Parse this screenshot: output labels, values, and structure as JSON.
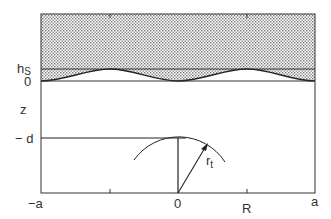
{
  "diagram": {
    "type": "schematic cross-section",
    "labels": {
      "hs": "h",
      "hs_sub": "S",
      "zero_z": "0",
      "z_axis": "z",
      "minus_d": "− d",
      "minus_a": "−a",
      "zero_x": "0",
      "R": "R",
      "a": "a",
      "rt": "r",
      "rt_sub": "t"
    },
    "colors": {
      "line": "#333333",
      "stipple_dot": "#7a7a7a",
      "background": "#ffffff"
    }
  }
}
